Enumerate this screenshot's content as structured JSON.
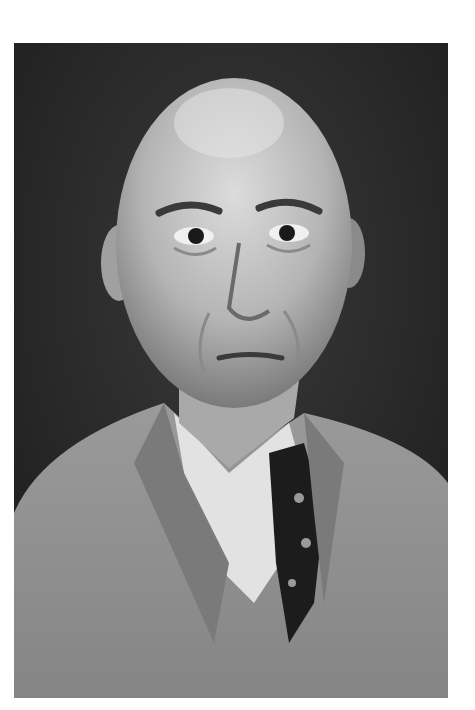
{
  "image": {
    "kind": "black-and-white portrait photograph",
    "subject": "bald middle-aged man in tweed suit jacket, white shirt and dark patterned tie",
    "palette": {
      "background": "#ffffff",
      "backdrop": "#2a2a2a",
      "skin_light": "#cfcfcf",
      "skin_mid": "#a8a8a8",
      "jacket": "#8e8e8e",
      "shirt": "#e6e6e6",
      "tie": "#1c1c1c"
    }
  }
}
